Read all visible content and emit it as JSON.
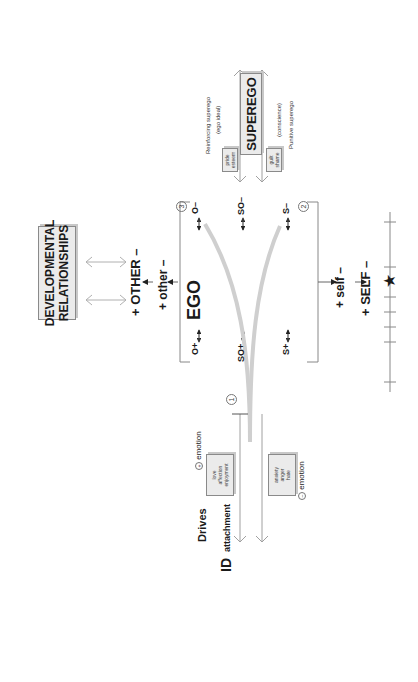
{
  "title_box": {
    "line1": "DEVELOPMENTAL",
    "line2": "RELATIONSHIPS"
  },
  "other_axis": {
    "upper": "+ OTHER –",
    "lower": "+ other –"
  },
  "self_axis": {
    "upper": "+ self –",
    "lower": "+ SELF –"
  },
  "ego": {
    "label": "EGO",
    "nodes_top": [
      "O+",
      "O–"
    ],
    "nodes_mid": [
      "SO+",
      "SO–"
    ],
    "nodes_bottom": [
      "S+",
      "S–"
    ],
    "markers": {
      "one": "1",
      "two": "2",
      "three": "3"
    }
  },
  "superego": {
    "label": "SUPEREGO",
    "reinforcing": "Reinforcing superego",
    "ego_ideal": "(ego ideal)",
    "conscience": "(conscience)",
    "punitive": "Punitive superego",
    "positive_box": [
      "pride",
      "esteem"
    ],
    "negative_box": [
      "guilt",
      "shame"
    ]
  },
  "id": {
    "label": "ID",
    "drives": "Drives",
    "attachment": "attachment",
    "positive_emotion": {
      "sign": "+",
      "label": "emotion",
      "items": [
        "love",
        "affection",
        "enjoyment"
      ]
    },
    "negative_emotion": {
      "sign": "–",
      "label": "emotion",
      "items": [
        "anxiety",
        "anger",
        "hate"
      ]
    }
  },
  "scale": {
    "marker": "★",
    "ticks": 7
  }
}
